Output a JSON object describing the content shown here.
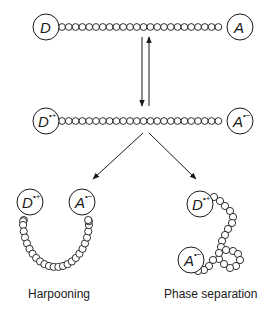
{
  "diagram": {
    "states": [
      {
        "id": "neutral",
        "donor": "D",
        "donor_charge": "",
        "acceptor": "A",
        "acceptor_charge": ""
      },
      {
        "id": "charge-separated",
        "donor": "D",
        "donor_charge": "•+",
        "acceptor": "A",
        "acceptor_charge": "•−"
      }
    ],
    "outcomes": [
      {
        "id": "harpooning",
        "label": "Harpooning",
        "donor": "D",
        "donor_charge": "•+",
        "acceptor": "A",
        "acceptor_charge": "•−"
      },
      {
        "id": "phase-separation",
        "label": "Phase separation",
        "donor": "D",
        "donor_charge": "•+",
        "acceptor": "A",
        "acceptor_charge": "•−"
      }
    ],
    "arrows": [
      {
        "from": "neutral",
        "to": "charge-separated",
        "type": "forward"
      },
      {
        "from": "charge-separated",
        "to": "neutral",
        "type": "reverse"
      },
      {
        "from": "charge-separated",
        "to": "harpooning"
      },
      {
        "from": "charge-separated",
        "to": "phase-separation"
      }
    ],
    "colors": {
      "stroke": "#1a1a1a",
      "background": "#ffffff"
    }
  }
}
